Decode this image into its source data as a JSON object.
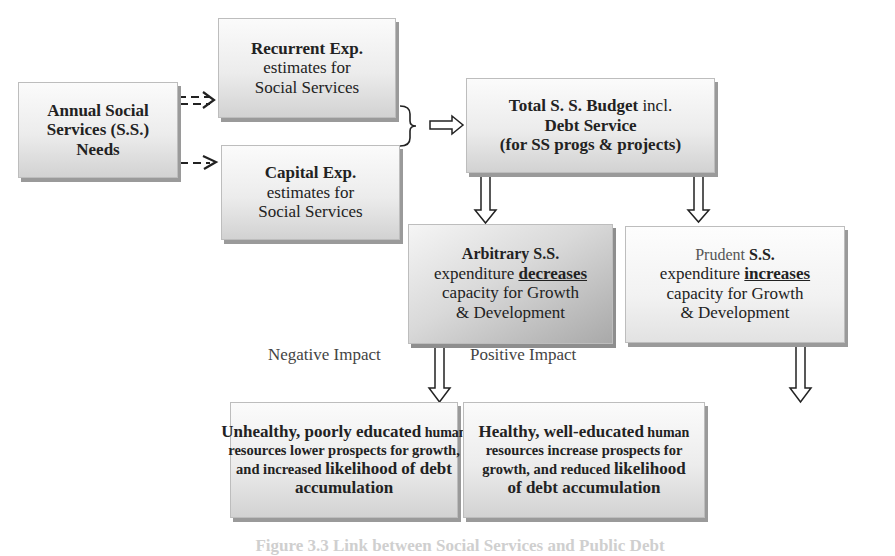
{
  "diagram": {
    "annual_needs": {
      "line1": "Annual Social",
      "line2": "Services (S.S.)",
      "line3": "Needs"
    },
    "recurrent": {
      "title": "Recurrent Exp.",
      "line2": "estimates for",
      "line3": "Social Services"
    },
    "capital": {
      "title": "Capital Exp.",
      "line2": "estimates for",
      "line3": "Social Services"
    },
    "total_budget": {
      "line1_bold": "Total S. S. Budget",
      "line1_normal": " incl.",
      "line2": "Debt Service",
      "line3": "(for SS progs & projects)"
    },
    "arbitrary": {
      "title": "Arbitrary S.S.",
      "line2_prefix": "expenditure ",
      "line2_emph": "decreases",
      "line3": "capacity for Growth",
      "line4": "& Development"
    },
    "prudent": {
      "title_normal": "Prudent",
      "title_bold": " S.S.",
      "line2_prefix": "expenditure ",
      "line2_emph": "increases",
      "line3": "capacity for Growth",
      "line4": "& Development"
    },
    "negative_label": "Negative Impact",
    "positive_label": "Positive Impact",
    "unhealthy": {
      "line1_big": "Unhealthy, poorly educated",
      "line1_small": " human",
      "line2": "resources lower prospects for growth,",
      "line3_a": "and increased ",
      "line3_b": "likelihood of debt",
      "line4": "accumulation"
    },
    "healthy": {
      "line1_big": "Healthy, well-educated",
      "line1_small": " human",
      "line2": "resources increase prospects for",
      "line3_a": "growth, and reduced ",
      "line3_b": "likelihood",
      "line4": "of debt accumulation"
    },
    "caption": "Figure 3.3 Link between Social Services and Public Debt"
  },
  "colors": {
    "box_light": "#f2f2f2",
    "box_mid": "#d2d2d2",
    "box_dark": "#a9a9a9",
    "shadow": "#9a9a9a",
    "text": "#222222",
    "connector": "#222222"
  }
}
